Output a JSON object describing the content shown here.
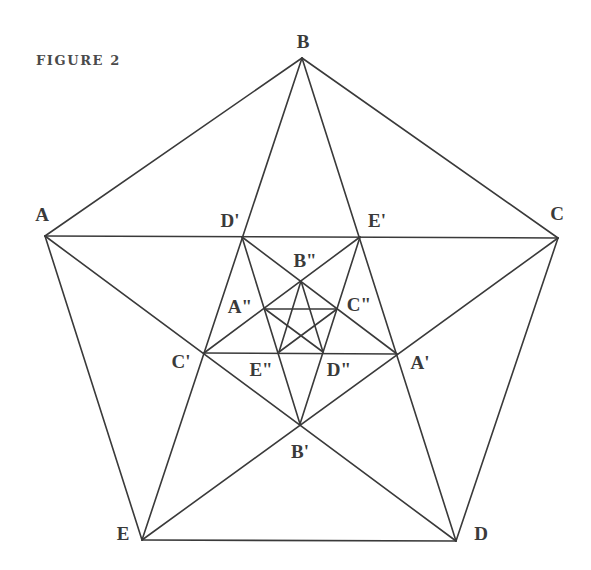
{
  "figure": {
    "caption": "FIGURE 2",
    "line_color": "#3a3a3a",
    "label_color": "#3a3a3a"
  },
  "vertices": {
    "A": {
      "x": 45,
      "y": 236,
      "label": "A",
      "label_x": 42,
      "label_y": 214
    },
    "B": {
      "x": 302,
      "y": 58,
      "label": "B",
      "label_x": 303,
      "label_y": 41
    },
    "C": {
      "x": 558,
      "y": 238,
      "label": "C",
      "label_x": 557,
      "label_y": 213
    },
    "D": {
      "x": 456,
      "y": 541,
      "label": "D",
      "label_x": 481,
      "label_y": 533
    },
    "E": {
      "x": 142,
      "y": 540,
      "label": "E",
      "label_x": 123,
      "label_y": 533
    },
    "A'": {
      "x": 397,
      "y": 354,
      "label": "A'",
      "label_x": 420,
      "label_y": 362
    },
    "B'": {
      "x": 300,
      "y": 424,
      "label": "B'",
      "label_x": 300,
      "label_y": 451
    },
    "C'": {
      "x": 204,
      "y": 353,
      "label": "C'",
      "label_x": 181,
      "label_y": 361
    },
    "D'": {
      "x": 242,
      "y": 237,
      "label": "D'",
      "label_x": 230,
      "label_y": 220
    },
    "E'": {
      "x": 360,
      "y": 237,
      "label": "E'",
      "label_x": 377,
      "label_y": 220
    },
    "A''": {
      "x": 265,
      "y": 309,
      "label": "A\"",
      "label_x": 240,
      "label_y": 306
    },
    "B''": {
      "x": 301,
      "y": 281,
      "label": "B\"",
      "label_x": 305,
      "label_y": 260
    },
    "C''": {
      "x": 337,
      "y": 309,
      "label": "C\"",
      "label_x": 359,
      "label_y": 304
    },
    "D''": {
      "x": 323,
      "y": 352,
      "label": "D\"",
      "label_x": 339,
      "label_y": 369
    },
    "E''": {
      "x": 279,
      "y": 352,
      "label": "E\"",
      "label_x": 261,
      "label_y": 369
    }
  },
  "edges": [
    [
      "A",
      "B"
    ],
    [
      "B",
      "C"
    ],
    [
      "C",
      "D"
    ],
    [
      "D",
      "E"
    ],
    [
      "E",
      "A"
    ],
    [
      "A",
      "C"
    ],
    [
      "A",
      "D"
    ],
    [
      "B",
      "D"
    ],
    [
      "B",
      "E"
    ],
    [
      "C",
      "E"
    ],
    [
      "D'",
      "A'"
    ],
    [
      "D'",
      "B'"
    ],
    [
      "E'",
      "C'"
    ],
    [
      "E'",
      "B'"
    ],
    [
      "C'",
      "A'"
    ],
    [
      "A''",
      "C''"
    ],
    [
      "B''",
      "E''"
    ],
    [
      "B''",
      "D''"
    ],
    [
      "A''",
      "D''"
    ],
    [
      "C''",
      "E''"
    ]
  ]
}
